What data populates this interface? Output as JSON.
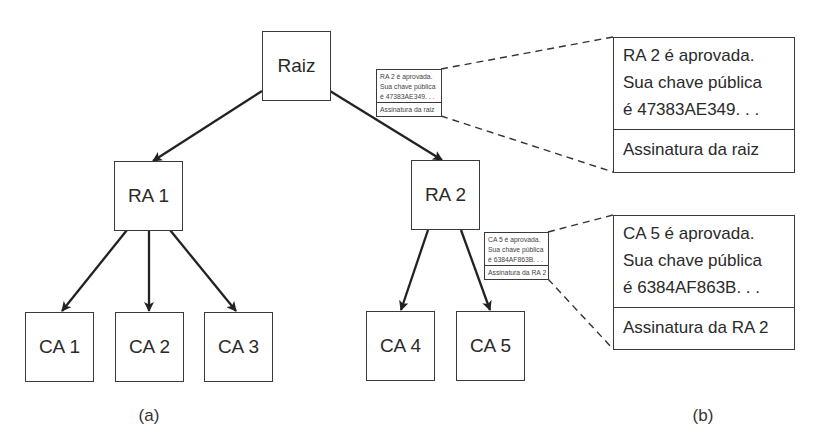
{
  "diagram": {
    "tree": {
      "root": {
        "label": "Raiz"
      },
      "ras": [
        {
          "label": "RA 1"
        },
        {
          "label": "RA 2"
        }
      ],
      "cas": [
        {
          "label": "CA 1",
          "parent": "RA 1"
        },
        {
          "label": "CA 2",
          "parent": "RA 1"
        },
        {
          "label": "CA 3",
          "parent": "RA 1"
        },
        {
          "label": "CA 4",
          "parent": "RA 2"
        },
        {
          "label": "CA 5",
          "parent": "RA 2"
        }
      ]
    },
    "certificates": [
      {
        "lines": [
          "RA 2 é aprovada.",
          "Sua chave pública",
          "é 47383AE349. . ."
        ],
        "signature": "Assinatura da raiz"
      },
      {
        "lines": [
          "CA 5 é aprovada.",
          "Sua chave pública",
          "é 6384AF863B. . ."
        ],
        "signature": "Assinatura da RA 2"
      }
    ],
    "captions": {
      "a": "(a)",
      "b": "(b)"
    },
    "colors": {
      "stroke": "#2a2a2a",
      "background": "#ffffff"
    }
  }
}
